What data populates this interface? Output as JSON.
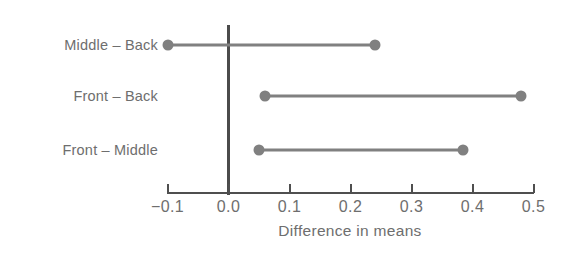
{
  "chart_data": {
    "type": "scatter",
    "title": "",
    "subtitle": "",
    "xlabel": "Difference in means",
    "ylabel": "",
    "xlim": [
      -0.1,
      0.5
    ],
    "xticks": [
      -0.1,
      0.0,
      0.1,
      0.2,
      0.3,
      0.4,
      0.5
    ],
    "xticklabels": [
      "−0.1",
      "0.0",
      "0.1",
      "0.2",
      "0.3",
      "0.4",
      "0.5"
    ],
    "grid": false,
    "legend": "none",
    "reference_line": 0.0,
    "categories": [
      "Middle – Back",
      "Front – Back",
      "Front – Middle"
    ],
    "intervals": [
      {
        "label": "Middle – Back",
        "lower": -0.1,
        "upper": 0.24
      },
      {
        "label": "Front – Back",
        "lower": 0.06,
        "upper": 0.48
      },
      {
        "label": "Front – Middle",
        "lower": 0.05,
        "upper": 0.385
      }
    ],
    "colors": {
      "interval": "#808080",
      "axis": "#4f4f4f",
      "reference_line": "#4b4b4b",
      "text": "#6e6e6e",
      "background": "#ffffff"
    }
  }
}
